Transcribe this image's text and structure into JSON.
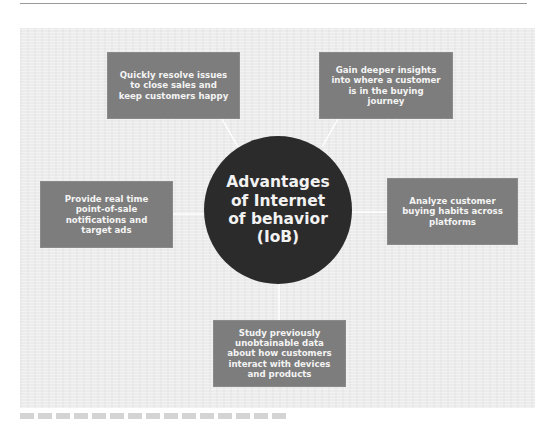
{
  "diagram": {
    "center": {
      "label": "Advantages of Internet of behavior (IoB)"
    },
    "nodes": [
      {
        "id": "top-left",
        "label": "Quickly resolve issues to close sales and keep customers happy"
      },
      {
        "id": "top-right",
        "label": "Gain deeper insights into where a customer is in the buying journey"
      },
      {
        "id": "left",
        "label": "Provide real time point-of-sale notifications and target ads"
      },
      {
        "id": "right",
        "label": "Analyze customer buying habits across platforms"
      },
      {
        "id": "bottom",
        "label": "Study previously unobtainable data about how customers interact with devices and products"
      }
    ],
    "colors": {
      "center_fill": "#2b2b2b",
      "node_fill": "#7d7d7d",
      "text": "#f4f4f4",
      "connector": "#ffffff",
      "background": "#ececec"
    }
  }
}
